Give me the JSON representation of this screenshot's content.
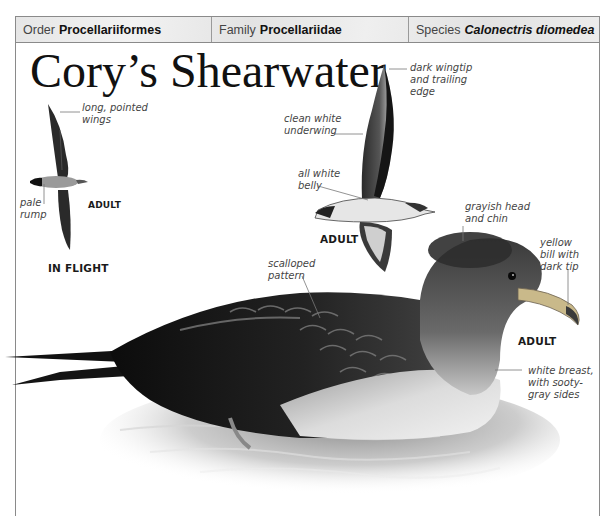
{
  "taxonomy": {
    "order": {
      "key": "Order",
      "value": "Procellariiformes"
    },
    "family": {
      "key": "Family",
      "value": "Procellariidae"
    },
    "species": {
      "key": "Species",
      "value": "Calonectris diomedea"
    }
  },
  "title": "Cory’s Shearwater",
  "images": {
    "flight_top": {
      "tag_adult": "ADULT",
      "caption": "IN FLIGHT",
      "callouts": {
        "wings": "long, pointed\nwings",
        "rump": "pale\nrump"
      }
    },
    "flight_under": {
      "tag_adult": "ADULT",
      "callouts": {
        "wingtip": "dark wingtip\nand trailing\nedge",
        "underwing": "clean white\nunderwing",
        "belly": "all white\nbelly"
      }
    },
    "swimming": {
      "tag_adult": "ADULT",
      "callouts": {
        "head": "grayish head\nand chin",
        "bill": "yellow\nbill with\ndark tip",
        "scalloped": "scalloped\npattern",
        "breast": "white breast,\nwith sooty-\ngray sides"
      }
    }
  },
  "colors": {
    "border": "#8a8a8a",
    "header_bg": "#e9e9e9",
    "text_dark": "#111111",
    "callout_text": "#444444",
    "bill_yellow": "#c9b98a"
  }
}
